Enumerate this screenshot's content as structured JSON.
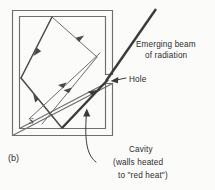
{
  "figure": {
    "panel_label": "(b)",
    "source_label": "S",
    "labels": {
      "emerging_beam_line1": "Emerging beam",
      "emerging_beam_line2": "of radiation",
      "hole": "Hole",
      "cavity_line1": "Cavity",
      "cavity_line2": "(walls heated",
      "cavity_line3": "to \"red heat\")"
    },
    "colors": {
      "background": "#fbfbfa",
      "wall": "#6f6f6f",
      "ray": "#6b6b6b",
      "beam": "#3a3a3a",
      "text": "#2d2d2d"
    }
  }
}
